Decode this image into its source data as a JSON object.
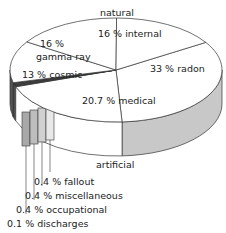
{
  "chart_data": {
    "type": "pie",
    "style": "3d-exploded",
    "title": "",
    "group_labels": {
      "top": "natural",
      "bottom": "artificial"
    },
    "slices": [
      {
        "label": "radon",
        "value": 33,
        "text": "33 % radon",
        "group": "natural",
        "side_color": "#c8c8c8"
      },
      {
        "label": "medical",
        "value": 20.7,
        "text": "20.7 % medical",
        "group": "artificial",
        "side_color": "#ffffff"
      },
      {
        "label": "fallout",
        "value": 0.4,
        "text": "0.4 % fallout",
        "group": "artificial",
        "side_color": "#e8e8e8"
      },
      {
        "label": "miscellaneous",
        "value": 0.4,
        "text": "0.4 % miscellaneous",
        "group": "artificial",
        "side_color": "#d0d0d0"
      },
      {
        "label": "occupational",
        "value": 0.4,
        "text": "0.4 % occupational",
        "group": "artificial",
        "side_color": "#bdbdbd"
      },
      {
        "label": "discharges",
        "value": 0.1,
        "text": "0.1 % discharges",
        "group": "artificial",
        "side_color": "#a8a8a8"
      },
      {
        "label": "cosmic",
        "value": 13,
        "text": "13 % cosmic",
        "group": "natural",
        "side_color": "#555555"
      },
      {
        "label": "gamma ray",
        "value": 16,
        "text": "16 % gamma ray",
        "group": "natural",
        "side_color": "#777777"
      },
      {
        "label": "internal",
        "value": 16,
        "text": "16 % internal",
        "group": "natural",
        "side_color": "#999999"
      }
    ]
  },
  "labels": {
    "natural": "natural",
    "artificial": "artificial",
    "internal": "16 % internal",
    "gamma_line1": "16 %",
    "gamma_line2": "gamma ray",
    "cosmic": "13 % cosmic",
    "radon": "33 % radon",
    "medical": "20.7 % medical",
    "fallout": "0.4 % fallout",
    "misc": "0.4 % miscellaneous",
    "occupational": "0.4 % occupational",
    "discharges": "0.1 % discharges"
  }
}
